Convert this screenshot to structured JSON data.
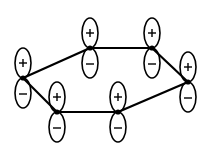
{
  "diagram": {
    "title": "",
    "atoms": [
      {
        "id": "a1",
        "x": 23,
        "y": 78,
        "top_sign": "+",
        "bottom_sign": "-"
      },
      {
        "id": "a2",
        "x": 90,
        "y": 48,
        "top_sign": "+",
        "bottom_sign": "-"
      },
      {
        "id": "a3",
        "x": 152,
        "y": 48,
        "top_sign": "+",
        "bottom_sign": "-"
      },
      {
        "id": "a4",
        "x": 188,
        "y": 82,
        "top_sign": "+",
        "bottom_sign": "-"
      },
      {
        "id": "a5",
        "x": 118,
        "y": 112,
        "top_sign": "+",
        "bottom_sign": "-"
      },
      {
        "id": "a6",
        "x": 57,
        "y": 112,
        "top_sign": "+",
        "bottom_sign": "-"
      }
    ],
    "bonds": [
      [
        "a1",
        "a2"
      ],
      [
        "a2",
        "a3"
      ],
      [
        "a3",
        "a4"
      ],
      [
        "a4",
        "a5"
      ],
      [
        "a5",
        "a6"
      ],
      [
        "a6",
        "a1"
      ]
    ],
    "lobe": {
      "rx": 8,
      "ry": 15
    },
    "colors": {
      "stroke": "#000000",
      "fill": "#ffffff"
    }
  }
}
